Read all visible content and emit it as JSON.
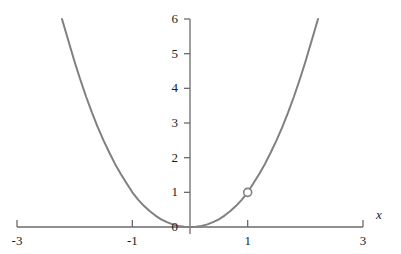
{
  "chart_data": {
    "type": "line",
    "title": "",
    "xlabel": "x",
    "ylabel": "",
    "xlim": [
      -3,
      3
    ],
    "ylim": [
      0,
      6
    ],
    "grid": false,
    "legend": null,
    "x_ticks": [
      {
        "value": -3,
        "label": "-3"
      },
      {
        "value": -1,
        "label": "-1"
      },
      {
        "value": 1,
        "label": "1"
      },
      {
        "value": 3,
        "label": "3"
      }
    ],
    "y_ticks": [
      {
        "value": 0,
        "label": "0"
      },
      {
        "value": 1,
        "label": "1"
      },
      {
        "value": 2,
        "label": "2"
      },
      {
        "value": 3,
        "label": "3"
      },
      {
        "value": 4,
        "label": "4"
      },
      {
        "value": 5,
        "label": "5"
      },
      {
        "value": 6,
        "label": "6"
      }
    ],
    "series": [
      {
        "name": "curve",
        "color": "#808080",
        "line_width": 2,
        "x": [
          -2.22,
          -2.1,
          -2.0,
          -1.9,
          -1.8,
          -1.7,
          -1.6,
          -1.5,
          -1.4,
          -1.3,
          -1.2,
          -1.1,
          -1.0,
          -0.9,
          -0.8,
          -0.7,
          -0.6,
          -0.5,
          -0.4,
          -0.3,
          -0.2,
          -0.1,
          0.0,
          0.1,
          0.2,
          0.3,
          0.4,
          0.5,
          0.6,
          0.7,
          0.8,
          0.9,
          1.0,
          1.1,
          1.2,
          1.3,
          1.4,
          1.5,
          1.6,
          1.7,
          1.8,
          1.9,
          2.0,
          2.1,
          2.22
        ],
        "y": [
          6.0,
          5.32,
          4.76,
          4.24,
          3.75,
          3.3,
          2.88,
          2.5,
          2.15,
          1.82,
          1.53,
          1.26,
          1.0,
          0.79,
          0.61,
          0.46,
          0.33,
          0.22,
          0.14,
          0.075,
          0.031,
          0.0056,
          0.0,
          0.0056,
          0.031,
          0.075,
          0.14,
          0.22,
          0.33,
          0.46,
          0.61,
          0.79,
          1.0,
          1.26,
          1.53,
          1.82,
          2.15,
          2.5,
          2.88,
          3.3,
          3.75,
          4.24,
          4.76,
          5.32,
          6.0
        ]
      }
    ],
    "markers": [
      {
        "name": "open-point",
        "x": 1,
        "y": 1,
        "style": "open-circle",
        "radius": 4,
        "fill": "#ffffff",
        "stroke": "#808080"
      }
    ],
    "colors": {
      "axis": "#6b6b6b",
      "curve": "#808080",
      "text": "#1a1a1a",
      "background": "#ffffff"
    }
  },
  "axes": {
    "x_axis_label": "x",
    "origin_label": "0"
  }
}
